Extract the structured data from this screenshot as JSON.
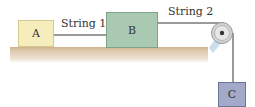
{
  "diagram": {
    "blocks": [
      {
        "id": "A",
        "label": "A",
        "color": "#f6edbc"
      },
      {
        "id": "B",
        "label": "B",
        "color": "#a9c9b3"
      },
      {
        "id": "C",
        "label": "C",
        "color": "#a3a9c9"
      }
    ],
    "strings": [
      {
        "id": "string1",
        "label": "String 1"
      },
      {
        "id": "string2",
        "label": "String 2"
      }
    ],
    "colors": {
      "table": "#d9c2a6",
      "pulley": "#b8b8b8",
      "bracket": "#bcd6e6",
      "rope": "#8f8f8f"
    }
  }
}
